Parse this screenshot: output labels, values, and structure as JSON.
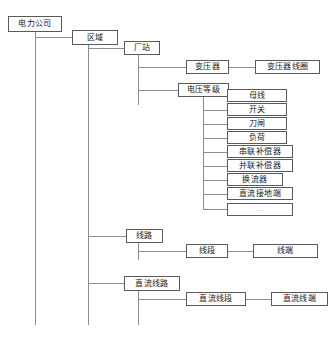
{
  "diagram": {
    "type": "tree",
    "line_color": "#8d8d8d",
    "box_border_color": "#5a5a5a",
    "background": "#ffffff",
    "nodes": {
      "company": "电力公司",
      "region": "区域",
      "station": "厂站",
      "transformer": "变压器",
      "transformer_winding": "变压器线圈",
      "voltage_level": "电压等级",
      "bus": "母线",
      "switch": "开关",
      "disconnector": "刀闸",
      "load": "负荷",
      "series_compensator": "串联补偿器",
      "shunt_compensator": "并联补偿器",
      "converter": "换流器",
      "dc_ground": "直流接地端",
      "more": "…",
      "line": "线路",
      "line_segment": "线段",
      "line_terminal": "线端",
      "dc_line": "直流线路",
      "dc_line_segment": "直流线段",
      "dc_line_terminal": "直流线端"
    }
  }
}
